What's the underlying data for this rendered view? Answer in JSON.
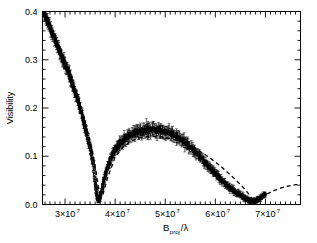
{
  "figure": {
    "title": "",
    "background": "#ffffff",
    "foreground": "#000000"
  },
  "axes": {
    "ylabel": "Visibility",
    "xlabel_base": "B",
    "xlabel_sub": "proj",
    "xlabel_tail": "/λ",
    "xlabel_full": "B_proj/λ",
    "x_tick_labels": [
      "3×10",
      "4×10",
      "5×10",
      "6×10",
      "7×10"
    ],
    "x_tick_exponent": "7",
    "x_tick_values": [
      30000000,
      40000000,
      50000000,
      60000000,
      70000000
    ],
    "y_tick_labels": [
      "0.0",
      "0.1",
      "0.2",
      "0.3",
      "0.4"
    ],
    "y_tick_values": [
      0.0,
      0.1,
      0.2,
      0.3,
      0.4
    ],
    "xlim": [
      25500000,
      77000000
    ],
    "ylim": [
      0.0,
      0.4
    ],
    "frame": "box",
    "minor_ticks": true,
    "grid": false
  },
  "chart_data": {
    "type": "scatter",
    "title": "",
    "xlabel": "B_proj/λ",
    "ylabel": "Visibility",
    "xlim": [
      25500000,
      77000000
    ],
    "ylim": [
      0.0,
      0.4
    ],
    "grid": false,
    "legend": "none",
    "series": [
      {
        "name": "measured visibility",
        "style": "points-with-errorbars",
        "color": "#000000",
        "marker": "square-open",
        "x": [
          25600000,
          26000000,
          26400000,
          26800000,
          27200000,
          27600000,
          28000000,
          28400000,
          28800000,
          29200000,
          29600000,
          30000000,
          30400000,
          30800000,
          31200000,
          31600000,
          32000000,
          32400000,
          32800000,
          33200000,
          33600000,
          34000000,
          34400000,
          34800000,
          35200000,
          35600000,
          36000000,
          36200000,
          36500000,
          36800000,
          37200000,
          37600000,
          38000000,
          38400000,
          38800000,
          39200000,
          39600000,
          40000000,
          40400000,
          40800000,
          41200000,
          41600000,
          42000000,
          42500000,
          43000000,
          43500000,
          44000000,
          44500000,
          45000000,
          45500000,
          46000000,
          46500000,
          47000000,
          47500000,
          48000000,
          48500000,
          49000000,
          49500000,
          50000000,
          50500000,
          51000000,
          51500000,
          52000000,
          52500000,
          53000000,
          53500000,
          54000000,
          54500000,
          55000000,
          55500000,
          56000000,
          56500000,
          57000000,
          57500000,
          58000000,
          58500000,
          59000000,
          59500000,
          60000000,
          60500000,
          61000000,
          61500000,
          62000000,
          62500000,
          63000000,
          63500000,
          64000000,
          64500000,
          65000000,
          65500000,
          66000000,
          66500000,
          67000000,
          67400000,
          67800000,
          68200000,
          68600000,
          69000000,
          69500000,
          70000000
        ],
        "y": [
          0.4,
          0.392,
          0.382,
          0.372,
          0.362,
          0.352,
          0.34,
          0.33,
          0.32,
          0.31,
          0.3,
          0.292,
          0.282,
          0.272,
          0.258,
          0.246,
          0.234,
          0.222,
          0.208,
          0.194,
          0.178,
          0.162,
          0.146,
          0.128,
          0.108,
          0.086,
          0.05,
          0.03,
          0.012,
          0.008,
          0.022,
          0.042,
          0.058,
          0.072,
          0.085,
          0.096,
          0.106,
          0.112,
          0.118,
          0.124,
          0.128,
          0.132,
          0.136,
          0.14,
          0.144,
          0.147,
          0.149,
          0.151,
          0.152,
          0.153,
          0.154,
          0.155,
          0.155,
          0.155,
          0.154,
          0.154,
          0.153,
          0.152,
          0.151,
          0.149,
          0.147,
          0.145,
          0.142,
          0.139,
          0.136,
          0.132,
          0.128,
          0.124,
          0.119,
          0.114,
          0.109,
          0.104,
          0.098,
          0.093,
          0.087,
          0.081,
          0.076,
          0.07,
          0.064,
          0.059,
          0.053,
          0.048,
          0.043,
          0.038,
          0.034,
          0.03,
          0.026,
          0.022,
          0.019,
          0.016,
          0.013,
          0.01,
          0.008,
          0.006,
          0.006,
          0.008,
          0.011,
          0.014,
          0.018,
          0.022
        ],
        "yerr": [
          0.012,
          0.012,
          0.013,
          0.013,
          0.013,
          0.013,
          0.013,
          0.013,
          0.013,
          0.013,
          0.013,
          0.013,
          0.013,
          0.013,
          0.013,
          0.012,
          0.012,
          0.012,
          0.012,
          0.012,
          0.011,
          0.011,
          0.011,
          0.01,
          0.01,
          0.01,
          0.009,
          0.008,
          0.007,
          0.007,
          0.008,
          0.008,
          0.009,
          0.009,
          0.01,
          0.01,
          0.011,
          0.011,
          0.011,
          0.012,
          0.012,
          0.012,
          0.012,
          0.013,
          0.013,
          0.013,
          0.013,
          0.013,
          0.014,
          0.014,
          0.014,
          0.018,
          0.014,
          0.014,
          0.014,
          0.014,
          0.014,
          0.014,
          0.014,
          0.013,
          0.013,
          0.013,
          0.013,
          0.013,
          0.013,
          0.012,
          0.012,
          0.012,
          0.012,
          0.012,
          0.011,
          0.011,
          0.011,
          0.011,
          0.01,
          0.01,
          0.01,
          0.01,
          0.009,
          0.009,
          0.009,
          0.009,
          0.008,
          0.008,
          0.008,
          0.008,
          0.007,
          0.007,
          0.007,
          0.007,
          0.006,
          0.006,
          0.006,
          0.006,
          0.006,
          0.006,
          0.006,
          0.006,
          0.006,
          0.006
        ]
      },
      {
        "name": "model fit",
        "style": "dashed-line",
        "color": "#000000",
        "dash": "4,3",
        "x": [
          25600000,
          27000000,
          28500000,
          30000000,
          31500000,
          33000000,
          34500000,
          35500000,
          36300000,
          36900000,
          37500000,
          38500000,
          40000000,
          41500000,
          43000000,
          44500000,
          46000000,
          47500000,
          49000000,
          50500000,
          52000000,
          53500000,
          55000000,
          56500000,
          58000000,
          59500000,
          61000000,
          62500000,
          64000000,
          65500000,
          66500000,
          67200000,
          67800000,
          68500000,
          70000000,
          71500000,
          73000000,
          74500000,
          76000000,
          77000000
        ],
        "y": [
          0.398,
          0.37,
          0.336,
          0.298,
          0.254,
          0.206,
          0.152,
          0.11,
          0.06,
          0.022,
          0.018,
          0.056,
          0.098,
          0.118,
          0.13,
          0.137,
          0.14,
          0.141,
          0.14,
          0.138,
          0.134,
          0.129,
          0.122,
          0.113,
          0.103,
          0.092,
          0.08,
          0.066,
          0.052,
          0.036,
          0.024,
          0.014,
          0.006,
          0.009,
          0.02,
          0.028,
          0.034,
          0.038,
          0.041,
          0.042
        ]
      }
    ]
  }
}
